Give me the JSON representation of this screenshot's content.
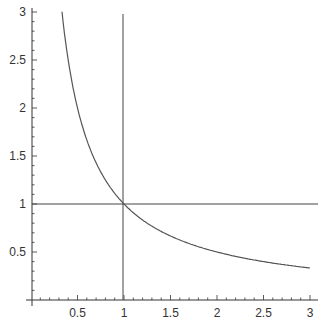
{
  "chart_data": {
    "type": "line",
    "title": "",
    "xlabel": "",
    "ylabel": "",
    "xlim": [
      0,
      3
    ],
    "ylim": [
      0,
      3
    ],
    "grid": false,
    "legend": null,
    "x_ticks": [
      "0.5",
      "1",
      "1.5",
      "2",
      "2.5",
      "3"
    ],
    "y_ticks": [
      "0.5",
      "1",
      "1.5",
      "2",
      "2.5",
      "3"
    ],
    "series": [
      {
        "name": "y = 1/x",
        "x": [
          0.333,
          0.4,
          0.5,
          0.6,
          0.75,
          1.0,
          1.25,
          1.5,
          1.75,
          2.0,
          2.25,
          2.5,
          2.75,
          3.0
        ],
        "values": [
          3.0,
          2.5,
          2.0,
          1.667,
          1.333,
          1.0,
          0.8,
          0.667,
          0.571,
          0.5,
          0.444,
          0.4,
          0.364,
          0.333
        ]
      }
    ],
    "reference_lines": [
      {
        "orientation": "vertical",
        "x": 1
      },
      {
        "orientation": "horizontal",
        "y": 1
      }
    ],
    "colors": {
      "line": "#555555",
      "axis": "#333333"
    }
  }
}
